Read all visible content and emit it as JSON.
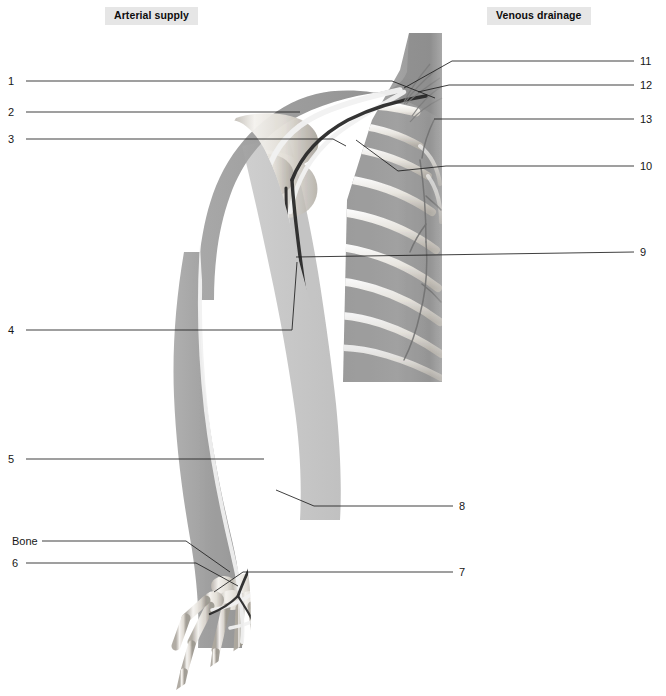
{
  "figure": {
    "title_left": "Arterial supply",
    "title_right": "Venous drainage",
    "palette": {
      "background": "#ffffff",
      "chip_background": "#e6e6e6",
      "text": "#171717",
      "leader_line": "#1d1d1d",
      "soft_tissue": "#9d9d9d",
      "torso_block": "#9a9a9a",
      "bone_light": "#f2f0ec",
      "bone_mid": "#cfcac2",
      "bone_shadow": "#a9a49c",
      "artery_dark": "#2b2b2b",
      "vein_light": "#efefef"
    }
  },
  "labels": {
    "left": [
      {
        "id": "1",
        "text": "1",
        "x": 8,
        "y": 76
      },
      {
        "id": "2",
        "text": "2",
        "x": 8,
        "y": 107
      },
      {
        "id": "3",
        "text": "3",
        "x": 8,
        "y": 134
      },
      {
        "id": "4",
        "text": "4",
        "x": 8,
        "y": 325
      },
      {
        "id": "5",
        "text": "5",
        "x": 8,
        "y": 454
      },
      {
        "id": "bone",
        "text": "Bone",
        "x": 12,
        "y": 536
      },
      {
        "id": "6",
        "text": "6",
        "x": 12,
        "y": 558
      }
    ],
    "right": [
      {
        "id": "11",
        "text": "11",
        "x": 640,
        "y": 56
      },
      {
        "id": "12",
        "text": "12",
        "x": 640,
        "y": 80
      },
      {
        "id": "13",
        "text": "13",
        "x": 640,
        "y": 114
      },
      {
        "id": "10",
        "text": "10",
        "x": 640,
        "y": 161
      },
      {
        "id": "9",
        "text": "9",
        "x": 640,
        "y": 247
      },
      {
        "id": "8",
        "text": "8",
        "x": 459,
        "y": 501
      },
      {
        "id": "7",
        "text": "7",
        "x": 459,
        "y": 567
      }
    ]
  },
  "leaders": [
    {
      "for": "1",
      "path": "M26 81 L392 81 L435 98"
    },
    {
      "for": "2",
      "path": "M26 112 L300 112"
    },
    {
      "for": "3",
      "path": "M26 139 L333 139 L346 146"
    },
    {
      "for": "4",
      "path": "M26 330 L292 330 L297 262"
    },
    {
      "for": "5",
      "path": "M26 459 L264 459"
    },
    {
      "for": "bone",
      "path": "M42 541 L186 541 L230 572"
    },
    {
      "for": "6",
      "path": "M26 563 L196 563 L238 586"
    },
    {
      "for": "11",
      "path": "M634 61 L452 61 L404 88"
    },
    {
      "for": "12",
      "path": "M634 85 L449 85 L418 92"
    },
    {
      "for": "13",
      "path": "M634 119 L434 119"
    },
    {
      "for": "10",
      "path": "M634 166 L446 166 L398 171 L356 140"
    },
    {
      "for": "9",
      "path": "M634 252 L296 257"
    },
    {
      "for": "8",
      "path": "M453 506 L314 506 L276 490"
    },
    {
      "for": "7",
      "path": "M453 572 L243 572 L214 592"
    }
  ]
}
